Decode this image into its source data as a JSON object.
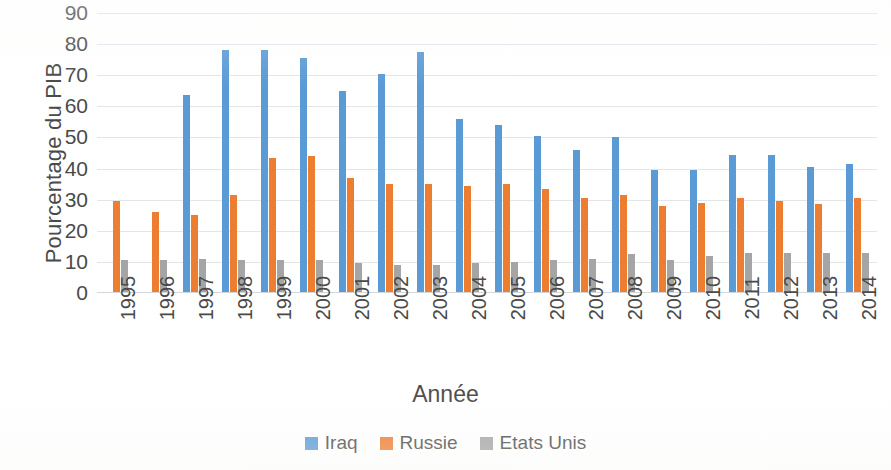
{
  "chart_data": {
    "type": "bar",
    "title": "",
    "xlabel": "Année",
    "ylabel": "Pourcentage du PIB",
    "ylim": [
      0,
      90
    ],
    "ytick_step": 10,
    "yticks": [
      90,
      80,
      70,
      60,
      50,
      40,
      30,
      20,
      10,
      0
    ],
    "grid": true,
    "legend_position": "bottom",
    "categories": [
      "1995",
      "1996",
      "1997",
      "1998",
      "1999",
      "2000",
      "2001",
      "2002",
      "2003",
      "2004",
      "2005",
      "2006",
      "2007",
      "2008",
      "2009",
      "2010",
      "2011",
      "2012",
      "2013",
      "2014"
    ],
    "series": [
      {
        "name": "Iraq",
        "color": "#5B9BD5",
        "values": [
          null,
          null,
          63.5,
          78,
          78,
          75.5,
          65,
          70.5,
          77.5,
          56,
          54,
          50.5,
          46,
          50,
          39.5,
          39.5,
          44.5,
          44.5,
          40.5,
          41.5
        ]
      },
      {
        "name": "Russie",
        "color": "#ED7D31",
        "values": [
          29.5,
          26,
          25,
          31.5,
          43.5,
          44,
          37,
          35,
          35,
          34.5,
          35,
          33.5,
          30.5,
          31.5,
          28,
          29,
          30.5,
          29.5,
          28.5,
          30.5
        ]
      },
      {
        "name": "Etats Unis",
        "color": "#A5A5A5",
        "values": [
          10.5,
          10.5,
          11,
          10.5,
          10.5,
          10.5,
          9.5,
          9,
          9,
          9.5,
          10,
          10.5,
          11,
          12.5,
          10.5,
          12,
          13,
          13,
          13,
          13
        ]
      }
    ]
  },
  "axes": {
    "y_title": "Pourcentage du PIB",
    "x_title": "Année"
  },
  "legend": {
    "items": [
      {
        "label": "Iraq",
        "color": "#5B9BD5"
      },
      {
        "label": "Russie",
        "color": "#ED7D31"
      },
      {
        "label": "Etats Unis",
        "color": "#A5A5A5"
      }
    ]
  }
}
